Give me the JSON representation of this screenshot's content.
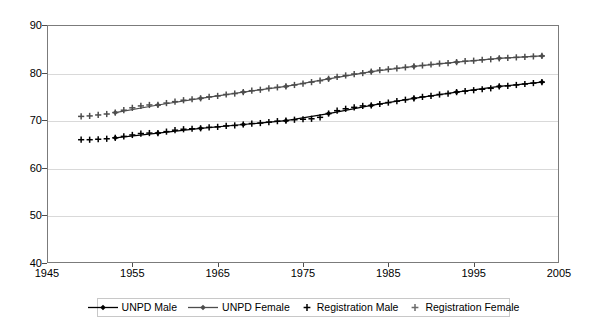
{
  "chart_data": {
    "type": "line",
    "title": "",
    "subtitle": "",
    "xlabel": "",
    "ylabel": "",
    "xlim": [
      1945,
      2005
    ],
    "ylim": [
      40,
      90
    ],
    "xticks": [
      1945,
      1955,
      1965,
      1975,
      1985,
      1995,
      2005
    ],
    "yticks": [
      40,
      50,
      60,
      70,
      80,
      90
    ],
    "grid": "horizontal",
    "legend_position": "bottom",
    "series": [
      {
        "name": "UNPD Male",
        "marker": "diamond",
        "line": true,
        "color": "#000000",
        "x": [
          1953,
          1958,
          1963,
          1968,
          1973,
          1978,
          1983,
          1988,
          1993,
          1998,
          2003
        ],
        "values": [
          66.3,
          67.3,
          68.3,
          69.1,
          69.9,
          71.4,
          73.1,
          74.6,
          75.9,
          77.1,
          78.0
        ]
      },
      {
        "name": "UNPD Female",
        "marker": "diamond",
        "line": true,
        "color": "#4d4d4d",
        "x": [
          1953,
          1958,
          1963,
          1968,
          1973,
          1978,
          1983,
          1988,
          1993,
          1998,
          2003
        ],
        "values": [
          71.6,
          73.2,
          74.6,
          75.9,
          77.1,
          78.7,
          80.2,
          81.3,
          82.2,
          83.0,
          83.5
        ]
      },
      {
        "name": "Registration Male",
        "marker": "plus",
        "line": false,
        "color": "#000000",
        "x": [
          1949,
          1950,
          1951,
          1952,
          1953,
          1954,
          1955,
          1956,
          1957,
          1958,
          1959,
          1960,
          1961,
          1962,
          1963,
          1964,
          1965,
          1966,
          1967,
          1968,
          1969,
          1970,
          1971,
          1972,
          1973,
          1974,
          1975,
          1976,
          1977,
          1978,
          1979,
          1980,
          1981,
          1982,
          1983,
          1984,
          1985,
          1986,
          1987,
          1988,
          1989,
          1990,
          1991,
          1992,
          1993,
          1994,
          1995,
          1996,
          1997,
          1998,
          1999,
          2000,
          2001,
          2002,
          2003
        ],
        "values": [
          65.9,
          65.9,
          66.0,
          66.1,
          66.3,
          66.6,
          66.9,
          67.2,
          67.3,
          67.3,
          67.6,
          67.9,
          68.1,
          68.2,
          68.3,
          68.5,
          68.6,
          68.8,
          68.9,
          69.1,
          69.3,
          69.4,
          69.6,
          69.8,
          69.9,
          70.1,
          70.2,
          70.3,
          70.6,
          71.4,
          72.0,
          72.4,
          72.7,
          73.0,
          73.1,
          73.4,
          73.7,
          74.0,
          74.3,
          74.6,
          74.9,
          75.1,
          75.4,
          75.6,
          75.9,
          76.1,
          76.3,
          76.5,
          76.7,
          77.1,
          77.2,
          77.4,
          77.6,
          77.8,
          78.0
        ]
      },
      {
        "name": "Registration Female",
        "marker": "plus",
        "line": false,
        "color": "#4d4d4d",
        "x": [
          1949,
          1950,
          1951,
          1952,
          1953,
          1954,
          1955,
          1956,
          1957,
          1958,
          1959,
          1960,
          1961,
          1962,
          1963,
          1964,
          1965,
          1966,
          1967,
          1968,
          1969,
          1970,
          1971,
          1972,
          1973,
          1974,
          1975,
          1976,
          1977,
          1978,
          1979,
          1980,
          1981,
          1982,
          1983,
          1984,
          1985,
          1986,
          1987,
          1988,
          1989,
          1990,
          1991,
          1992,
          1993,
          1994,
          1995,
          1996,
          1997,
          1998,
          1999,
          2000,
          2001,
          2002,
          2003
        ],
        "values": [
          70.8,
          70.9,
          71.1,
          71.3,
          71.6,
          72.1,
          72.6,
          73.0,
          73.2,
          73.2,
          73.6,
          73.9,
          74.2,
          74.4,
          74.6,
          74.9,
          75.1,
          75.4,
          75.6,
          75.9,
          76.2,
          76.4,
          76.7,
          76.9,
          77.1,
          77.4,
          77.7,
          78.0,
          78.3,
          78.7,
          79.1,
          79.4,
          79.7,
          79.9,
          80.2,
          80.5,
          80.7,
          80.9,
          81.1,
          81.3,
          81.5,
          81.7,
          81.9,
          82.0,
          82.2,
          82.4,
          82.5,
          82.7,
          82.8,
          83.0,
          83.1,
          83.2,
          83.3,
          83.4,
          83.5
        ]
      }
    ]
  },
  "axes": {
    "y_tick_labels": [
      "90",
      "80",
      "70",
      "60",
      "50",
      "40"
    ],
    "x_tick_labels": [
      "1945",
      "1955",
      "1965",
      "1975",
      "1985",
      "1995",
      "2005"
    ]
  },
  "legend": {
    "items": [
      {
        "label": "UNPD Male",
        "icon": "line-diamond-marker",
        "color": "#000000"
      },
      {
        "label": "UNPD Female",
        "icon": "line-diamond-marker",
        "color": "#4d4d4d"
      },
      {
        "label": "Registration Male",
        "icon": "plus-marker",
        "color": "#000000"
      },
      {
        "label": "Registration Female",
        "icon": "plus-marker",
        "color": "#6b6b6b"
      }
    ]
  }
}
